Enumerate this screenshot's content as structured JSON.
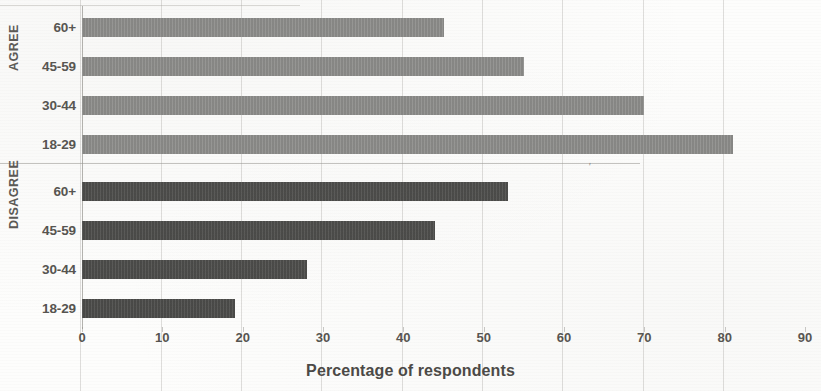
{
  "chart_data": {
    "type": "bar",
    "orientation": "horizontal",
    "title": "",
    "xlabel": "Percentage of respondents",
    "ylabel": "",
    "xlim": [
      0,
      90
    ],
    "xticks": [
      0,
      10,
      20,
      30,
      40,
      50,
      60,
      70,
      80,
      90
    ],
    "xtick_labels": [
      "0",
      "10",
      "20",
      "30",
      "40",
      "50",
      "60",
      "70",
      "80",
      "90"
    ],
    "grid": true,
    "grid_axis": "x",
    "legend": "none",
    "categories": [
      "18-29",
      "30-44",
      "45-59",
      "60+"
    ],
    "groups": [
      {
        "name": "AGREE",
        "color": "#8a8a88",
        "bars": [
          {
            "category": "60+",
            "value": 45
          },
          {
            "category": "45-59",
            "value": 55
          },
          {
            "category": "30-44",
            "value": 70
          },
          {
            "category": "18-29",
            "value": 81
          }
        ]
      },
      {
        "name": "DISAGREE",
        "color": "#4c4c4a",
        "bars": [
          {
            "category": "60+",
            "value": 53
          },
          {
            "category": "45-59",
            "value": 44
          },
          {
            "category": "30-44",
            "value": 28
          },
          {
            "category": "18-29",
            "value": 19
          }
        ]
      }
    ],
    "series": [
      {
        "name": "AGREE",
        "categories": [
          "60+",
          "45-59",
          "30-44",
          "18-29"
        ],
        "values": [
          45,
          55,
          70,
          81
        ]
      },
      {
        "name": "DISAGREE",
        "categories": [
          "60+",
          "45-59",
          "30-44",
          "18-29"
        ],
        "values": [
          53,
          44,
          28,
          19
        ]
      }
    ]
  },
  "axis": {
    "x_title": "Percentage of respondents",
    "ticks": [
      "0",
      "10",
      "20",
      "30",
      "40",
      "50",
      "60",
      "70",
      "80",
      "90"
    ]
  },
  "group_labels": {
    "agree": "AGREE",
    "disagree": "DISAGREE"
  },
  "category_labels": {
    "agree": [
      "60+",
      "45-59",
      "30-44",
      "18-29"
    ],
    "disagree": [
      "60+",
      "45-59",
      "30-44",
      "18-29"
    ]
  },
  "colors": {
    "agree_bar": "#8a8a88",
    "disagree_bar": "#4c4c4a",
    "background": "#fdfdfc",
    "gridline": "#a0a09a",
    "text": "#55534f"
  },
  "artifacts": {
    "stray_mark": "'"
  }
}
